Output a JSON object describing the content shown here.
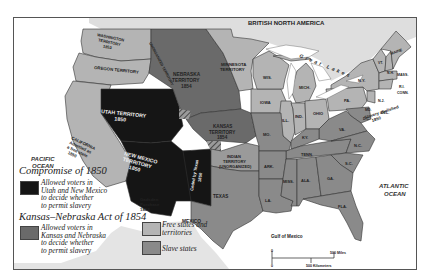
{
  "map": {
    "title_region": "BRITISH NORTH AMERICA",
    "colors": {
      "free": "#b4b4b4",
      "slave": "#8a8a8a",
      "compromise_1850": "#151515",
      "kansas_nebraska": "#6a6a6a",
      "water": "#ffffff",
      "canada": "#dedede",
      "mexico": "#e4e4e4"
    },
    "regions": {
      "washington": [
        "WASHINGTON",
        "TERRITORY",
        "1853"
      ],
      "oregon": "OREGON TERRITORY",
      "california": [
        "CALIFORNIA",
        "Admitted as",
        "a free state",
        "1850"
      ],
      "utah": [
        "UTAH TERRITORY",
        "1850"
      ],
      "new_mexico": [
        "NEW MEXICO",
        "TERRITORY",
        "1850"
      ],
      "nebraska": [
        "NEBRASKA",
        "TERRITORY",
        "1854"
      ],
      "unorganized": "UNORGANIZED TERRITORY",
      "minnesota": [
        "MINNESOTA",
        "TERRITORY"
      ],
      "kansas": [
        "KANSAS",
        "TERRITORY",
        "1854"
      ],
      "indian": [
        "INDIAN",
        "TERRITORY",
        "(UNORGANIZED)"
      ],
      "ceded": [
        "Ceded by Texas",
        "1850"
      ],
      "gadsden": [
        "Gadsden",
        "Purchase",
        "1853"
      ],
      "mexico": "MEXICO",
      "texas": "TEXAS",
      "great_lakes": "Great Lakes",
      "gulf": "Gulf of Mexico",
      "dc": [
        "Slavery abolished",
        "1850"
      ]
    },
    "states": [
      "WIS.",
      "MICH.",
      "IOWA",
      "ILL.",
      "IND.",
      "OHIO",
      "PA.",
      "N.Y.",
      "VT.",
      "N.H.",
      "MAINE",
      "MASS.",
      "R.I.",
      "CONN.",
      "N.J.",
      "DEL.",
      "MD.",
      "VA.",
      "MO.",
      "KY.",
      "TENN.",
      "N.C.",
      "S.C.",
      "ARK.",
      "LA.",
      "MISS.",
      "ALA.",
      "GA.",
      "FLA.",
      "D.C."
    ],
    "oceans": {
      "pacific": [
        "PACIFIC",
        "OCEAN"
      ],
      "atlantic": [
        "ATLANTIC",
        "OCEAN"
      ]
    },
    "scale": {
      "zero_top": "0",
      "zero_bottom": "0",
      "miles": "500 Miles",
      "km": "500 Kilometers"
    }
  },
  "legend": {
    "compromise_title": "Compromise of 1850",
    "compromise_text": "Allowed voters in\nUtah and New Mexico\nto decide whether\nto permit slavery",
    "kn_title": "Kansas–Nebraska Act of 1854",
    "kn_text": "Allowed voters in\nKansas and Nebraska\nto decide whether\nto permit slavery",
    "free_text": "Free states and\nterritories",
    "slave_text": "Slave states"
  }
}
